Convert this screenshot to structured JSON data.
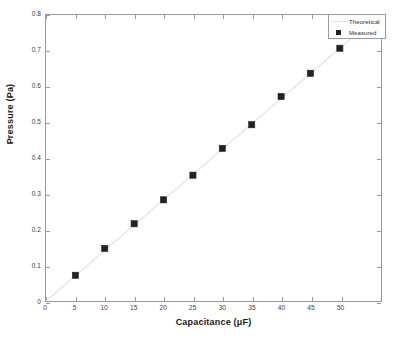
{
  "chart_data": {
    "type": "scatter",
    "title": "",
    "xlabel": "Capacitance (μF)",
    "ylabel": "Pressure (Pa)",
    "xlim": [
      0,
      57
    ],
    "ylim": [
      0,
      0.8
    ],
    "grid": false,
    "legend_position": "top-right",
    "xticks": [
      0,
      5,
      10,
      15,
      20,
      25,
      30,
      35,
      40,
      45,
      50
    ],
    "xticklabels": [
      "0",
      "5",
      "10",
      "15",
      "20",
      "25",
      "30",
      "35",
      "40",
      "45",
      "50"
    ],
    "yticks": [
      0,
      0.1,
      0.2,
      0.3,
      0.4,
      0.5,
      0.6,
      0.7,
      0.8
    ],
    "yticklabels": [
      "0",
      "0.1",
      "0.2",
      "0.3",
      "0.4",
      "0.5",
      "0.6",
      "0.7",
      "0.8"
    ],
    "series": [
      {
        "name": "Theoretical",
        "type": "line",
        "color": "#e0e0e0",
        "x": [
          0,
          57
        ],
        "values": [
          0,
          0.8065
        ]
      },
      {
        "name": "Measured",
        "type": "scatter",
        "marker": "square",
        "color": "#222222",
        "x": [
          5,
          10,
          15,
          20,
          25,
          30,
          35,
          40,
          45,
          50
        ],
        "values": [
          0.072,
          0.147,
          0.216,
          0.283,
          0.352,
          0.427,
          0.493,
          0.572,
          0.637,
          0.707
        ]
      }
    ]
  },
  "legend": {
    "entries": [
      {
        "label": "Theoretical"
      },
      {
        "label": "Measured"
      }
    ]
  },
  "colors": {
    "background": "#ffffff",
    "axis": "#9a9a9a",
    "theoretical_line": "#e0e0e0",
    "measured_marker": "#222222",
    "tick_label": "#3c3c3c",
    "axis_title": "#1a1a1a"
  }
}
